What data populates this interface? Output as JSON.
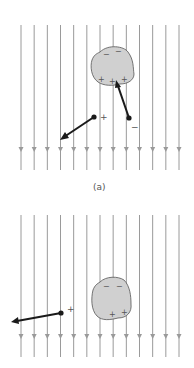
{
  "figure": {
    "field_line_count": 13,
    "field_direction": "down",
    "panels": [
      {
        "id": "a",
        "label": "(a)",
        "object_signs": {
          "top": [
            "−",
            "−"
          ],
          "bottom": [
            "+",
            "+",
            "+"
          ]
        },
        "charges": [
          {
            "sign": "+",
            "force_direction": "away-left-down"
          },
          {
            "sign": "−",
            "force_direction": "toward-object"
          }
        ]
      },
      {
        "id": "b",
        "label": "",
        "object_signs": {
          "top": [
            "−",
            "−"
          ],
          "bottom": [
            "+",
            "+"
          ]
        },
        "charges": [
          {
            "sign": "+",
            "force_direction": "left"
          }
        ]
      }
    ]
  }
}
